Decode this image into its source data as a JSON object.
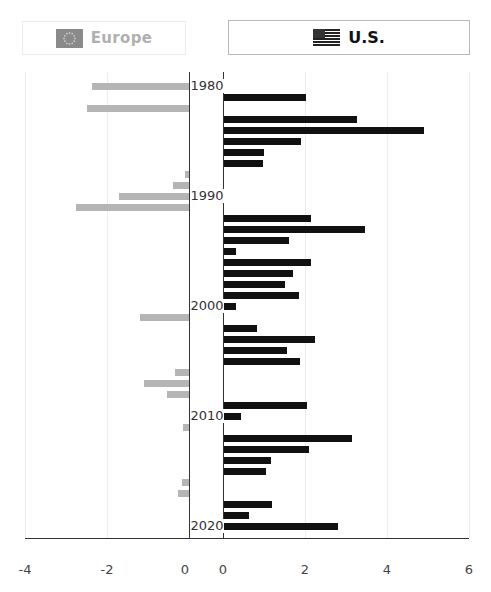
{
  "toggle": {
    "europe": {
      "label": "Europe",
      "icon": "eu-flag-icon",
      "active": false,
      "color": "#b0b0b0"
    },
    "us": {
      "label": "U.S.",
      "icon": "us-flag-icon",
      "active": true,
      "color": "#111111"
    }
  },
  "chart_data": {
    "type": "bar",
    "orientation": "horizontal",
    "title": "",
    "layout": "butterfly: Europe panel (left, axis -4 to 0) and U.S. panel (right, axis 0 to 6), years on vertical axis",
    "year_labels": [
      "1980",
      "1990",
      "2000",
      "2010",
      "2020"
    ],
    "year_range": [
      1980,
      2020
    ],
    "grid": true,
    "panels": [
      {
        "name": "Europe",
        "color": "#b5b5b5",
        "xlim": [
          -4,
          0
        ],
        "ticks": [
          "-4",
          "-2",
          "0"
        ],
        "points": [
          {
            "year": 1980,
            "value": -2.36
          },
          {
            "year": 1982,
            "value": -2.48
          },
          {
            "year": 1988,
            "value": -0.1
          },
          {
            "year": 1989,
            "value": -0.38
          },
          {
            "year": 1990,
            "value": -1.7
          },
          {
            "year": 1991,
            "value": -2.76
          },
          {
            "year": 2001,
            "value": -1.2
          },
          {
            "year": 2006,
            "value": -0.34
          },
          {
            "year": 2007,
            "value": -1.1
          },
          {
            "year": 2008,
            "value": -0.54
          },
          {
            "year": 2011,
            "value": -0.15
          },
          {
            "year": 2016,
            "value": -0.17
          },
          {
            "year": 2017,
            "value": -0.27
          }
        ]
      },
      {
        "name": "U.S.",
        "color": "#111111",
        "xlim": [
          0,
          6
        ],
        "ticks": [
          "0",
          "2",
          "4",
          "6"
        ],
        "points": [
          {
            "year": 1981,
            "value": 2.0
          },
          {
            "year": 1983,
            "value": 3.24
          },
          {
            "year": 1984,
            "value": 4.89
          },
          {
            "year": 1985,
            "value": 1.89
          },
          {
            "year": 1986,
            "value": 0.98
          },
          {
            "year": 1987,
            "value": 0.95
          },
          {
            "year": 1992,
            "value": 2.13
          },
          {
            "year": 1993,
            "value": 3.43
          },
          {
            "year": 1994,
            "value": 1.59
          },
          {
            "year": 1995,
            "value": 0.29
          },
          {
            "year": 1996,
            "value": 2.13
          },
          {
            "year": 1997,
            "value": 1.69
          },
          {
            "year": 1998,
            "value": 1.48
          },
          {
            "year": 1999,
            "value": 1.82
          },
          {
            "year": 2000,
            "value": 0.29
          },
          {
            "year": 2002,
            "value": 0.8
          },
          {
            "year": 2003,
            "value": 2.22
          },
          {
            "year": 2004,
            "value": 1.53
          },
          {
            "year": 2005,
            "value": 1.85
          },
          {
            "year": 2009,
            "value": 2.02
          },
          {
            "year": 2010,
            "value": 0.41
          },
          {
            "year": 2012,
            "value": 3.11
          },
          {
            "year": 2013,
            "value": 2.08
          },
          {
            "year": 2014,
            "value": 1.15
          },
          {
            "year": 2015,
            "value": 1.02
          },
          {
            "year": 2018,
            "value": 1.18
          },
          {
            "year": 2019,
            "value": 0.6
          },
          {
            "year": 2020,
            "value": 2.77
          }
        ]
      }
    ]
  }
}
